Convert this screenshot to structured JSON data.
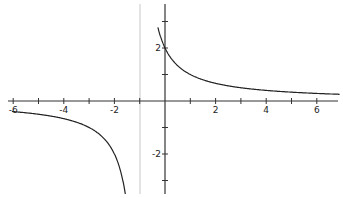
{
  "chart_data": {
    "type": "line",
    "title": "",
    "xlabel": "",
    "ylabel": "",
    "function": "y = 2/(x+1)",
    "vertical_asymptote": -1,
    "horizontal_asymptote": 0,
    "xlim": [
      -6.5,
      7
    ],
    "ylim": [
      -3.8,
      3.8
    ],
    "grid": false,
    "x_ticks": [
      -6,
      -5,
      -4,
      -3,
      -2,
      -1,
      1,
      2,
      3,
      4,
      5,
      6
    ],
    "x_tick_labels": [
      "-6",
      "-4",
      "-2",
      "2",
      "4",
      "6"
    ],
    "x_tick_label_values": [
      -6,
      -4,
      -2,
      2,
      4,
      6
    ],
    "y_ticks": [
      -3,
      -2,
      -1,
      1,
      2,
      3
    ],
    "y_tick_labels": [
      "2",
      "-2"
    ],
    "y_tick_label_values": [
      2,
      -2
    ],
    "series": [
      {
        "name": "right branch",
        "x": [
          -0.3,
          0,
          0.5,
          1,
          2,
          3,
          4,
          5,
          6,
          6.9
        ],
        "y": [
          2.86,
          2,
          1.33,
          1,
          0.67,
          0.5,
          0.4,
          0.33,
          0.29,
          0.25
        ]
      },
      {
        "name": "left branch",
        "x": [
          -6,
          -5,
          -4,
          -3,
          -2,
          -1.5,
          -1.6
        ],
        "y": [
          -0.4,
          -0.5,
          -0.67,
          -1,
          -2,
          -4,
          -3.33
        ]
      }
    ],
    "colors": {
      "curve": "#222222",
      "axes": "#333333",
      "asymptote": "#c8c8c8"
    }
  }
}
